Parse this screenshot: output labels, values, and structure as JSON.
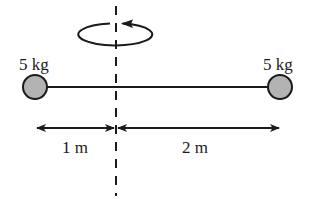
{
  "diagram": {
    "type": "rotating-dumbbell",
    "colors": {
      "stroke": "#1a1a1a",
      "mass_fill": "#b3b3b3",
      "background": "#ffffff"
    },
    "masses": [
      {
        "label": "5 kg",
        "side": "left"
      },
      {
        "label": "5 kg",
        "side": "right"
      }
    ],
    "distances": [
      {
        "label": "1 m",
        "segment": "left-mass-to-axis"
      },
      {
        "label": "2 m",
        "segment": "axis-to-right-mass"
      }
    ],
    "rotation": {
      "direction": "counterclockwise-viewed-from-above",
      "axis_style": "dashed-vertical"
    }
  }
}
